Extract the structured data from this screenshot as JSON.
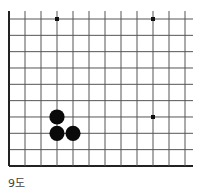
{
  "caption": "9도",
  "board": {
    "columns": 12,
    "rows": 10,
    "origin_x": 9,
    "origin_y": 19,
    "step_x": 16,
    "step_y": 16.33,
    "line_end_x": 193,
    "edges": {
      "left": true,
      "bottom": true,
      "top": false,
      "right": false
    },
    "line_color": "#555555",
    "edge_color": "#222222",
    "star_points": [
      [
        3,
        0
      ],
      [
        9,
        0
      ],
      [
        9,
        6
      ]
    ],
    "stones": [
      {
        "col": 3,
        "row": 6,
        "color": "black"
      },
      {
        "col": 3,
        "row": 7,
        "color": "black"
      },
      {
        "col": 4,
        "row": 7,
        "color": "black"
      }
    ]
  }
}
